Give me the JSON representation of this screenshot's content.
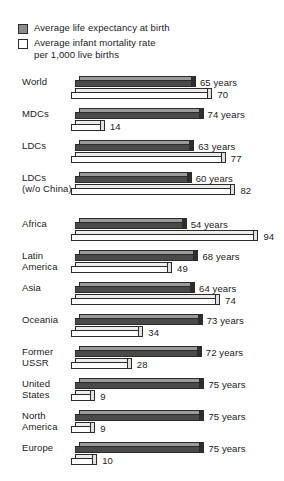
{
  "legend": {
    "items": [
      {
        "swatch": "filled-gray-square",
        "label": "Average life expectancy at birth"
      },
      {
        "swatch": "hollow-white-square",
        "label": "Average infant mortality rate\nper 1,000 live births"
      }
    ]
  },
  "colors": {
    "life_expectancy_fill": "#4a4a4a",
    "life_expectancy_top": "#9a9a9a",
    "infant_mortality_fill": "#ffffff",
    "infant_mortality_top": "#ececec",
    "outline": "#2b2b2b",
    "background": "#ffffff",
    "text": "#1a1a1a"
  },
  "chart_data": {
    "type": "bar",
    "orientation": "horizontal",
    "title": "",
    "subtitle": "",
    "xlabel": "",
    "ylabel": "",
    "grid": false,
    "legend_position": "top-left",
    "series": [
      {
        "name": "Average life expectancy at birth",
        "unit": "years",
        "value_suffix": " years",
        "values": [
          65,
          74,
          63,
          60,
          54,
          68,
          64,
          73,
          72,
          75,
          75,
          75
        ]
      },
      {
        "name": "Average infant mortality rate per 1,000 live births",
        "unit": "per 1,000 live births",
        "value_suffix": "",
        "values": [
          70,
          14,
          77,
          82,
          94,
          49,
          74,
          34,
          28,
          9,
          9,
          10
        ]
      }
    ],
    "categories": [
      "World",
      "MDCs",
      "LDCs",
      "LDCs\n(w/o China)",
      "Africa",
      "Latin\nAmerica",
      "Asia",
      "Oceania",
      "Former\nUSSR",
      "United\nStates",
      "North\nAmerica",
      "Europe"
    ],
    "value_labels": {
      "life_expectancy": [
        "65 years",
        "74 years",
        "63 years",
        "60 years",
        "54 years",
        "68 years",
        "64 years",
        "73 years",
        "72 years",
        "75 years",
        "75 years",
        "75 years"
      ],
      "infant_mortality": [
        "70",
        "14",
        "77",
        "82",
        "94",
        "49",
        "74",
        "34",
        "28",
        "9",
        "9",
        "10"
      ]
    },
    "group_break_after_index": 3
  }
}
